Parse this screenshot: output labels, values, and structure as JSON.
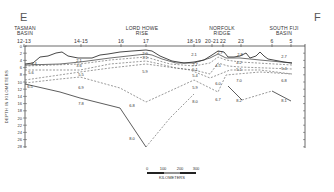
{
  "figure": {
    "start_label": "E",
    "end_label": "F",
    "regions": [
      {
        "name_line1": "TASMAN",
        "name_line2": "BASIN",
        "stations": "12-13",
        "x": 24
      },
      {
        "name_line1": "LORD HOWE",
        "name_line2": "RISE",
        "stations": "",
        "x": 140
      },
      {
        "name_line1": "NORFOLK",
        "name_line2": "RIDGE",
        "stations": "",
        "x": 222
      },
      {
        "name_line1": "SOUTH FIJI",
        "name_line2": "BASIN",
        "stations": "",
        "x": 287
      }
    ],
    "station_labels": [
      {
        "text": "12-13",
        "x": 24
      },
      {
        "text": "14-15",
        "x": 81
      },
      {
        "text": "16",
        "x": 121
      },
      {
        "text": "17",
        "x": 146
      },
      {
        "text": "18-19",
        "x": 194
      },
      {
        "text": "20-21",
        "x": 212
      },
      {
        "text": "22",
        "x": 223
      },
      {
        "text": "23",
        "x": 241
      },
      {
        "text": "6",
        "x": 272
      },
      {
        "text": "5",
        "x": 291
      }
    ],
    "y_axis": {
      "title": "DEPTH IN KILOMETERS",
      "ticks": [
        "0",
        "2",
        "4",
        "6",
        "8",
        "10",
        "12",
        "14",
        "16",
        "18",
        "20",
        "22",
        "24",
        "26",
        "28"
      ]
    },
    "velocities": [
      {
        "text": "2.0",
        "x": 145,
        "y": 55
      },
      {
        "text": "3.1",
        "x": 145,
        "y": 58
      },
      {
        "text": "2.1",
        "x": 79,
        "y": 62
      },
      {
        "text": "3.6",
        "x": 79,
        "y": 67
      },
      {
        "text": "3.4",
        "x": 34,
        "y": 64
      },
      {
        "text": "5.6",
        "x": 31,
        "y": 73
      },
      {
        "text": "5.5",
        "x": 81,
        "y": 75
      },
      {
        "text": "5.9",
        "x": 145,
        "y": 72
      },
      {
        "text": "6.5",
        "x": 28,
        "y": 87
      },
      {
        "text": "6.9",
        "x": 81,
        "y": 88
      },
      {
        "text": "7.8",
        "x": 81,
        "y": 104
      },
      {
        "text": "6.8",
        "x": 132,
        "y": 106
      },
      {
        "text": "8.0",
        "x": 132,
        "y": 139
      },
      {
        "text": "2.1",
        "x": 194,
        "y": 55
      },
      {
        "text": "2.7",
        "x": 220,
        "y": 53
      },
      {
        "text": "2.8",
        "x": 240,
        "y": 55
      },
      {
        "text": "2.7",
        "x": 284,
        "y": 57
      },
      {
        "text": "2.7",
        "x": 195,
        "y": 65
      },
      {
        "text": "4.5",
        "x": 218,
        "y": 66
      },
      {
        "text": "4.2",
        "x": 239,
        "y": 63
      },
      {
        "text": "5.1",
        "x": 195,
        "y": 70
      },
      {
        "text": "5.4",
        "x": 195,
        "y": 76
      },
      {
        "text": "5.1",
        "x": 239,
        "y": 70
      },
      {
        "text": "5.4",
        "x": 284,
        "y": 69
      },
      {
        "text": "6.0",
        "x": 218,
        "y": 84
      },
      {
        "text": "7.0",
        "x": 239,
        "y": 81
      },
      {
        "text": "6.8",
        "x": 284,
        "y": 81
      },
      {
        "text": "5.9",
        "x": 195,
        "y": 88
      },
      {
        "text": "8.0",
        "x": 195,
        "y": 102
      },
      {
        "text": "6.7",
        "x": 218,
        "y": 100
      },
      {
        "text": "8.2",
        "x": 239,
        "y": 101
      },
      {
        "text": "8.1",
        "x": 284,
        "y": 101
      }
    ],
    "scale_bar": {
      "ticks": [
        "0",
        "100",
        "200",
        "300"
      ],
      "unit": "KILOMETERS"
    }
  }
}
